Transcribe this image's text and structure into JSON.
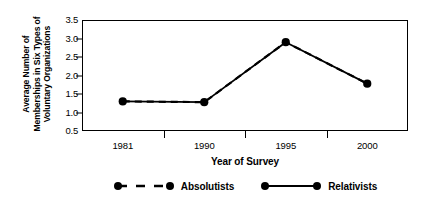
{
  "chart_data": {
    "type": "line",
    "title": "",
    "xlabel": "Year of Survey",
    "ylabel": "Average Number of Memberships in Six Types of Voluntary Organizations",
    "ylabel_lines": [
      "Average Number of",
      "Memberships in Six Types of",
      "Voluntary Organizations"
    ],
    "categories": [
      "1981",
      "1990",
      "1995",
      "2000"
    ],
    "x_tick_labels": [
      "1981",
      "1990",
      "1995",
      "2000"
    ],
    "y_tick_labels": [
      "3.5",
      "3.0",
      "2.5",
      "2.0",
      "1.5",
      "1.0",
      "0.5"
    ],
    "y_ticks": [
      3.5,
      3.0,
      2.5,
      2.0,
      1.5,
      1.0,
      0.5
    ],
    "ylim": [
      0.5,
      3.5
    ],
    "grid": false,
    "legend_position": "bottom",
    "series": [
      {
        "name": "Absolutists",
        "values": [
          1.3,
          1.28,
          2.9,
          1.78
        ],
        "line_style": "dashed",
        "marker": "circle",
        "color": "#000000"
      },
      {
        "name": "Relativists",
        "values": [
          1.3,
          1.28,
          2.9,
          1.78
        ],
        "line_style": "solid",
        "marker": "circle",
        "color": "#000000"
      }
    ]
  },
  "legend": {
    "entries": [
      {
        "label": "Absolutists",
        "style": "dashed"
      },
      {
        "label": "Relativists",
        "style": "solid"
      }
    ]
  },
  "colors": {
    "ink": "#000000",
    "background": "#ffffff"
  }
}
